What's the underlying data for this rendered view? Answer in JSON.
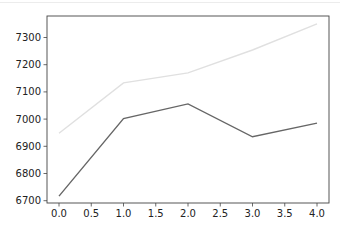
{
  "chart_data": {
    "type": "line",
    "title": "",
    "xlabel": "",
    "ylabel": "",
    "x": [
      0,
      1,
      2,
      3,
      4
    ],
    "series": [
      {
        "name": "series-light",
        "color": "#e0e0e0",
        "values": [
          6948,
          7133,
          7170,
          7254,
          7350
        ]
      },
      {
        "name": "series-dark",
        "color": "#666666",
        "values": [
          6717,
          7002,
          7056,
          6935,
          6985
        ]
      }
    ],
    "xlim": [
      -0.2,
      4.2
    ],
    "ylim": [
      6688,
      7380
    ],
    "xticks": [
      "0.0",
      "0.5",
      "1.0",
      "1.5",
      "2.0",
      "2.5",
      "3.0",
      "3.5",
      "4.0"
    ],
    "yticks": [
      "6700",
      "6800",
      "6900",
      "7000",
      "7100",
      "7200",
      "7300"
    ],
    "grid": false,
    "legend": null
  }
}
